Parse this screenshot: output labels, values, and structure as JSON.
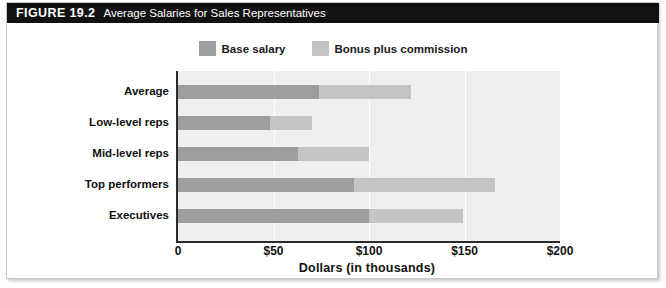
{
  "caption": {
    "number": "FIGURE 19.2",
    "title": "Average Salaries for Sales Representatives"
  },
  "legend": {
    "position": "top-center",
    "items": [
      {
        "label": "Base salary",
        "color": "#9e9e9e",
        "name": "base-salary"
      },
      {
        "label": "Bonus plus commission",
        "color": "#c4c4c4",
        "name": "bonus-plus-commission"
      }
    ]
  },
  "colors": {
    "base_salary": "#9e9e9e",
    "bonus_commission": "#c4c4c4",
    "plot_background": "#efefef",
    "gridline": "#ffffff",
    "axis": "#2b2b2b",
    "caption_bar": "#111111",
    "caption_text": "#ffffff"
  },
  "axis": {
    "x_title": "Dollars (in thousands)",
    "x_ticks": [
      "0",
      "$50",
      "$100",
      "$150",
      "$200"
    ],
    "x_tick_values": [
      0,
      50,
      100,
      150,
      200
    ],
    "x_min": 0,
    "x_max": 200
  },
  "chart_data": {
    "type": "bar",
    "orientation": "horizontal",
    "stacked": true,
    "title": "Average Salaries for Sales Representatives",
    "xlabel": "Dollars (in thousands)",
    "ylabel": "",
    "xlim": [
      0,
      200
    ],
    "grid": true,
    "grid_axis": "x",
    "legend_position": "top-center",
    "categories": [
      "Average",
      "Low-level reps",
      "Mid-level reps",
      "Top performers",
      "Executives"
    ],
    "series": [
      {
        "name": "Base salary",
        "color": "#9e9e9e",
        "values": [
          74,
          48,
          63,
          92,
          100
        ]
      },
      {
        "name": "Bonus plus commission",
        "color": "#c4c4c4",
        "values": [
          48,
          22,
          37,
          74,
          49
        ]
      }
    ],
    "totals": [
      122,
      70,
      100,
      166,
      149
    ],
    "units": "thousands of dollars"
  }
}
